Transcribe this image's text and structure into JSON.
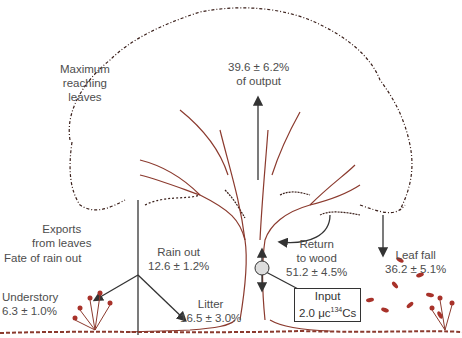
{
  "diagram": {
    "colors": {
      "tree_outline": "#8b3a2e",
      "canopy": "#3a1f1a",
      "arrow": "#333333",
      "text": "#4d4d4d",
      "leaves": "#a8322a"
    },
    "labels": {
      "max_leaves": [
        "Maximum",
        "reaching",
        "leaves"
      ],
      "output": [
        "39.6 ± 6.2%",
        "of output"
      ],
      "exports": [
        "Exports",
        "from leaves"
      ],
      "fate_rain": "Fate of rain out",
      "understory": [
        "Understory",
        "6.3 ± 1.0%"
      ],
      "rain_out": [
        "Rain out",
        "12.6 ± 1.2%"
      ],
      "litter": [
        "Litter",
        "16.5 ± 3.0%"
      ],
      "return_wood": [
        "Return",
        "to wood",
        "51.2 ± 4.5%"
      ],
      "leaf_fall": [
        "Leaf fall",
        "36.2 ± 5.1%"
      ],
      "input": {
        "line1": "Input",
        "line2_prefix": "2.0 μc",
        "sup": "134",
        "line2_suffix": "Cs"
      }
    }
  }
}
